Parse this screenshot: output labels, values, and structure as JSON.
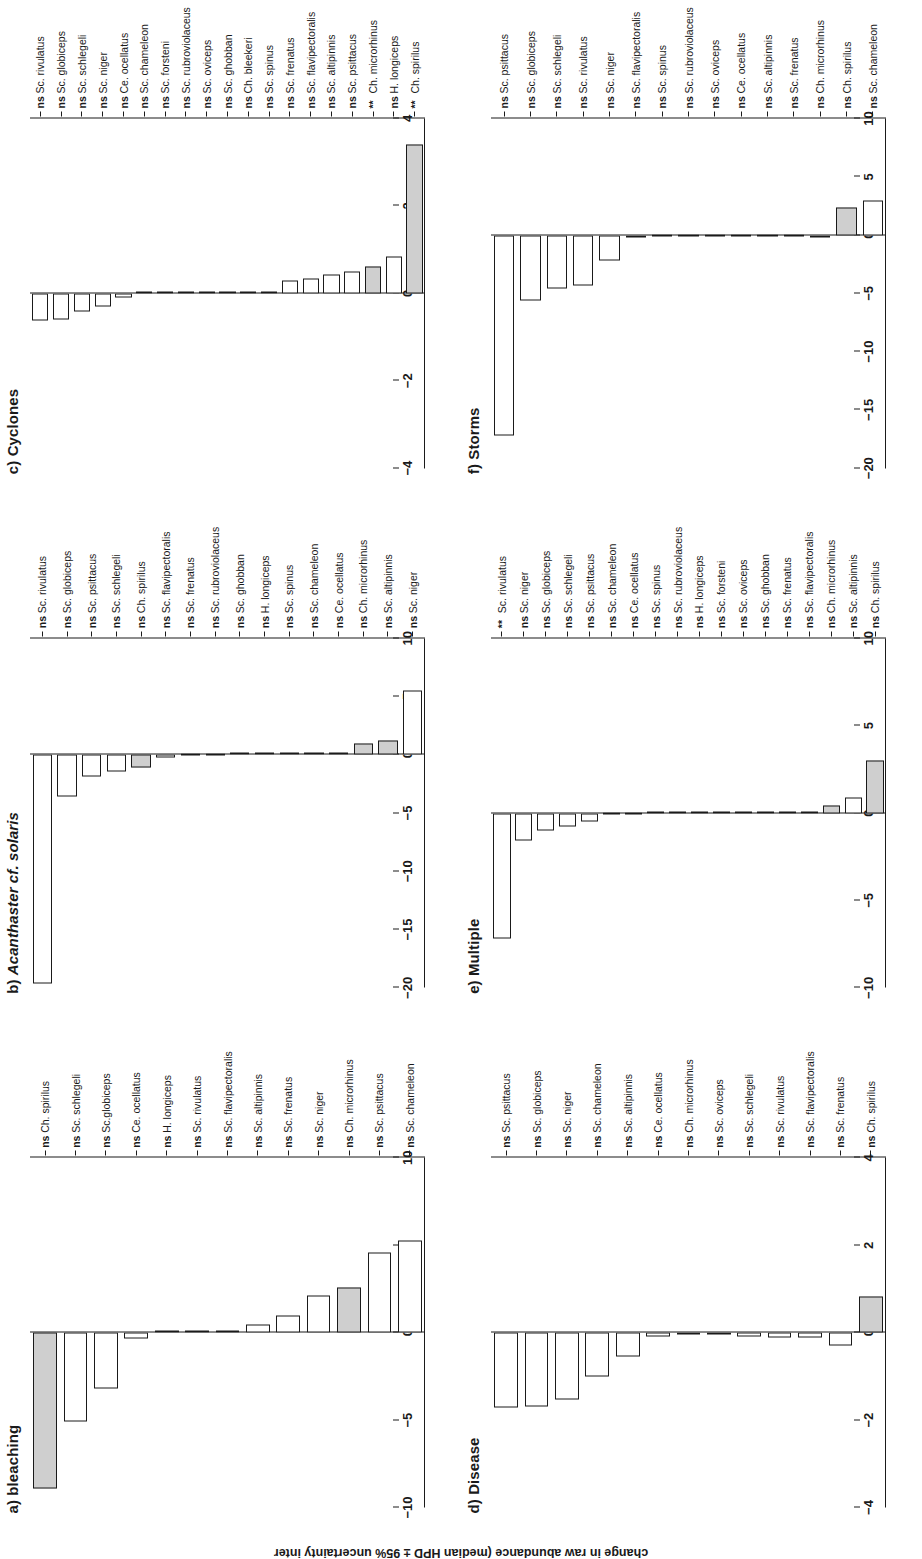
{
  "figure": {
    "y_axis_caption": "change in raw abundance (median HPD ± 95% uncertainty inter"
  },
  "chart_data": [
    {
      "id": "a",
      "type": "bar",
      "title": "a) bleaching",
      "title_plain": "a) bleaching",
      "xlabel": "",
      "ylabel": "change in raw abundance (median HPD ± 95% uncertainty interval)",
      "ylim": [
        -10,
        10
      ],
      "ticks": [
        10,
        5,
        0,
        -5,
        -10
      ],
      "categories": [
        "Ch. spirilus",
        "Sc. schlegeli",
        "Sc.globiceps",
        "Ce. ocellatus",
        "H. longiceps",
        "Sc. rivulatus",
        "Sc. flavipectoralis",
        "Sc. altipinnis",
        "Sc. frenatus",
        "Sc. niger",
        "Ch. microrhinus",
        "Sc. psittacus",
        "Sc. chameleon"
      ],
      "values": [
        -8.9,
        -5.1,
        -3.2,
        -0.35,
        0.05,
        0.1,
        0.15,
        0.45,
        1.0,
        2.1,
        2.6,
        4.6,
        5.3
      ],
      "shaded": [
        true,
        false,
        false,
        false,
        false,
        false,
        false,
        false,
        false,
        false,
        true,
        false,
        false
      ],
      "significance": [
        "ns",
        "ns",
        "ns",
        "ns",
        "ns",
        "ns",
        "ns",
        "ns",
        "ns",
        "ns",
        "ns",
        "ns",
        "ns"
      ]
    },
    {
      "id": "b",
      "type": "bar",
      "title": "b) Acanthaster cf. solaris",
      "title_plain": "b) Acanthaster cf. solaris",
      "xlabel": "",
      "ylabel": "",
      "ylim": [
        -20,
        10
      ],
      "ticks": [
        10,
        5,
        0,
        -5,
        -10,
        -15,
        -20
      ],
      "categories": [
        "Sc. rivulatus",
        "Sc. globiceps",
        "Sc. psittacus",
        "Sc. schlegeli",
        "Ch. spirilus",
        "Sc. flavipectoralis",
        "Sc. frenatus",
        "Sc. rubroviolaceus",
        "Sc. ghobban",
        "H. longiceps",
        "Sc. spinus",
        "Sc. chameleon",
        "Ce. ocellatus",
        "Ch. microrhinus",
        "Sc. altipinnis",
        "Sc. niger"
      ],
      "values": [
        -19.6,
        -3.6,
        -1.9,
        -1.4,
        -1.1,
        -0.2,
        -0.1,
        -0.1,
        0.05,
        0.1,
        0.1,
        0.15,
        0.2,
        1.0,
        1.2,
        5.5
      ],
      "shaded": [
        false,
        false,
        false,
        false,
        true,
        false,
        false,
        false,
        false,
        false,
        false,
        false,
        false,
        true,
        true,
        false
      ],
      "significance": [
        "ns",
        "ns",
        "ns",
        "ns",
        "ns",
        "ns",
        "ns",
        "ns",
        "ns",
        "ns",
        "ns",
        "ns",
        "ns",
        "ns",
        "ns",
        "ns"
      ]
    },
    {
      "id": "c",
      "type": "bar",
      "title": "c) Cyclones",
      "title_plain": "c) Cyclones",
      "xlabel": "",
      "ylabel": "",
      "ylim": [
        -4,
        4
      ],
      "ticks": [
        4,
        2,
        0,
        -2,
        -4
      ],
      "categories": [
        "Sc. rivulatus",
        "Sc. globiceps",
        "Sc. schlegeli",
        "Sc. niger",
        "Ce. ocellatus",
        "Sc. chameleon",
        "Sc. forsteni",
        "Sc. rubroviolaceus",
        "Sc. oviceps",
        "Sc. ghobban",
        "Ch. bleekeri",
        "Sc. spinus",
        "Sc. frenatus",
        "Sc. flavipectoralis",
        "Sc. altipinnis",
        "Sc. psittacus",
        "Ch. microrhinus",
        "H. longiceps",
        "Ch. spirilus"
      ],
      "values": [
        -0.62,
        -0.6,
        -0.42,
        -0.3,
        -0.1,
        0.02,
        0.02,
        0.02,
        0.03,
        0.03,
        0.04,
        0.05,
        0.3,
        0.35,
        0.42,
        0.5,
        0.62,
        0.85,
        3.4
      ],
      "shaded": [
        false,
        false,
        false,
        false,
        false,
        false,
        false,
        false,
        false,
        false,
        false,
        false,
        false,
        false,
        false,
        false,
        true,
        false,
        true
      ],
      "significance": [
        "ns",
        "ns",
        "ns",
        "ns",
        "ns",
        "ns",
        "ns",
        "ns",
        "ns",
        "ns",
        "ns",
        "ns",
        "ns",
        "ns",
        "ns",
        "ns",
        "**",
        "ns",
        "**"
      ]
    },
    {
      "id": "d",
      "type": "bar",
      "title": "d) Disease",
      "title_plain": "d) Disease",
      "xlabel": "",
      "ylabel": "",
      "ylim": [
        -4,
        4
      ],
      "ticks": [
        4,
        2,
        0,
        -2,
        -4
      ],
      "categories": [
        "Sc. psittacus",
        "Sc. globiceps",
        "Sc. niger",
        "Sc. chameleon",
        "Sc. altipinnis",
        "Ce. ocellatus",
        "Ch. microrhinus",
        "Sc. oviceps",
        "Sc. schlegeli",
        "Sc. rivulatus",
        "Sc. flavipectoralis",
        "Sc. frenatus",
        "Ch. spirilus"
      ],
      "values": [
        -1.72,
        -1.68,
        -1.52,
        -1.0,
        -0.55,
        -0.08,
        -0.05,
        -0.05,
        -0.08,
        -0.1,
        -0.12,
        -0.3,
        0.82
      ],
      "shaded": [
        false,
        false,
        false,
        false,
        false,
        false,
        false,
        false,
        false,
        false,
        false,
        false,
        true
      ],
      "significance": [
        "ns",
        "ns",
        "ns",
        "ns",
        "ns",
        "ns",
        "ns",
        "ns",
        "ns",
        "ns",
        "ns",
        "ns",
        "ns"
      ]
    },
    {
      "id": "e",
      "type": "bar",
      "title": "e) Multiple",
      "title_plain": "e) Multiple",
      "xlabel": "",
      "ylabel": "",
      "ylim": [
        -10,
        10
      ],
      "ticks": [
        10,
        5,
        0,
        -5,
        -10
      ],
      "categories": [
        "Sc. rivulatus",
        "Sc. niger",
        "Sc. globiceps",
        "Sc. schlegeli",
        "Sc. psittacus",
        "Sc. chameleon",
        "Ce. ocellatus",
        "Sc. spinus",
        "Sc. rubroviolaceus",
        "H. longiceps",
        "Sc. forsteni",
        "Sc. oviceps",
        "Sc. ghobban",
        "Sc. frenatus",
        "Sc. flavipectoralis",
        "Ch. microrhinus",
        "Sc. altipinnis",
        "Ch. spirilus"
      ],
      "values": [
        -7.2,
        -1.6,
        -1.0,
        -0.8,
        -0.5,
        -0.1,
        -0.1,
        -0.05,
        -0.05,
        -0.05,
        0.02,
        0.03,
        0.03,
        0.05,
        0.1,
        0.45,
        0.9,
        3.0
      ],
      "shaded": [
        false,
        false,
        false,
        false,
        false,
        false,
        false,
        false,
        false,
        false,
        false,
        false,
        false,
        false,
        false,
        true,
        false,
        true
      ],
      "significance": [
        "**",
        "ns",
        "ns",
        "ns",
        "ns",
        "ns",
        "ns",
        "ns",
        "ns",
        "ns",
        "ns",
        "ns",
        "ns",
        "ns",
        "ns",
        "ns",
        "ns",
        "ns"
      ]
    },
    {
      "id": "f",
      "type": "bar",
      "title": "f) Storms",
      "title_plain": "f) Storms",
      "xlabel": "",
      "ylabel": "",
      "ylim": [
        -20,
        10
      ],
      "ticks": [
        10,
        5,
        0,
        -5,
        -10,
        -15,
        -20
      ],
      "categories": [
        "Sc. psittacus",
        "Sc. globiceps",
        "Sc. schlegeli",
        "Sc. rivulatus",
        "Sc. niger",
        "Sc. flavipectoralis",
        "Sc. spinus",
        "Sc. rubroviolaceus",
        "Sc. oviceps",
        "Ce. ocellatus",
        "Sc. altipinnis",
        "Sc. frenatus",
        "Ch. microrhinus",
        "Ch. spirilus",
        "Sc. chameleon"
      ],
      "values": [
        -17.2,
        -5.6,
        -4.6,
        -4.3,
        -2.2,
        -0.2,
        -0.1,
        -0.1,
        -0.1,
        -0.1,
        -0.1,
        -0.15,
        -0.2,
        2.4,
        3.0
      ],
      "shaded": [
        false,
        false,
        false,
        false,
        false,
        false,
        false,
        false,
        false,
        false,
        false,
        false,
        false,
        true,
        false
      ],
      "significance": [
        "ns",
        "ns",
        "ns",
        "ns",
        "ns",
        "ns",
        "ns",
        "ns",
        "ns",
        "ns",
        "ns",
        "ns",
        "ns",
        "ns",
        "ns"
      ]
    }
  ]
}
